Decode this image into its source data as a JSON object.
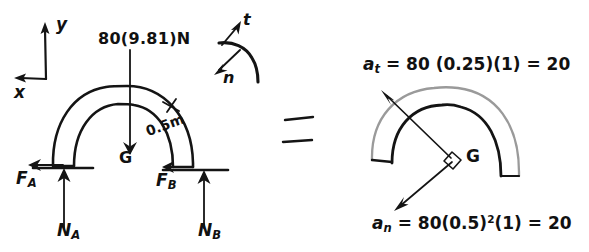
{
  "figure": {
    "title_text": "",
    "type": "free-body-diagram-and-kinetic-diagram",
    "colors": {
      "ink": "#141414",
      "faded_ink": "#9a9a9a",
      "background": "#ffffff"
    }
  },
  "axes": {
    "global": {
      "y_label": "y",
      "x_label": "x",
      "y_direction": "up",
      "x_direction": "left"
    },
    "path": {
      "t_label": "t",
      "n_label": "n",
      "t_direction": "up-left-tangent",
      "n_direction": "down-left-normal"
    }
  },
  "free_body_diagram": {
    "weight_label": "80(9.81)N",
    "center_of_mass_label": "G",
    "radius_dimension_label": "0.5m",
    "left_support": {
      "friction_label": "F",
      "friction_subscript": "A",
      "normal_label": "N",
      "normal_subscript": "A"
    },
    "right_support": {
      "friction_label": "F",
      "friction_subscript": "B",
      "normal_label": "N",
      "normal_subscript": "B"
    }
  },
  "equals_sign": "=",
  "kinetic_diagram": {
    "center_of_mass_label": "G",
    "tangential": {
      "symbol": "a",
      "subscript": "t",
      "equation": "= 80 (0.25)(1) = 20",
      "full_text": "a_t = 80 (0.25)(1) = 20",
      "mass": "80",
      "alpha_r": "0.25",
      "factor": "1",
      "result": "20"
    },
    "normal": {
      "symbol": "a",
      "subscript": "n",
      "equation_before_exponent": "= 80(0.5)",
      "exponent": "2",
      "equation_after_exponent": "(1) = 20",
      "full_text": "a_n = 80(0.5)^2(1) = 20",
      "mass": "80",
      "omega": "0.5",
      "factor": "1",
      "result": "20"
    },
    "right_angle_marker": true
  }
}
